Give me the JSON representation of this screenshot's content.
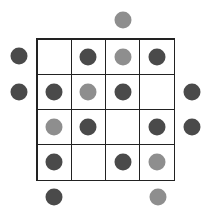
{
  "puzzle": {
    "rows": 4,
    "cols": 4,
    "colors": {
      "dark": "#4a4a4a",
      "light": "#8e8e8e",
      "grid_line": "#222222"
    },
    "grid": [
      [
        "empty",
        "dark",
        "light",
        "dark"
      ],
      [
        "dark",
        "light",
        "dark",
        "empty"
      ],
      [
        "light",
        "dark",
        "empty",
        "dark"
      ],
      [
        "dark",
        "empty",
        "dark",
        "light"
      ]
    ],
    "clues": {
      "top": [
        "empty",
        "empty",
        "light",
        "empty"
      ],
      "left": [
        "dark",
        "dark",
        "empty",
        "empty"
      ],
      "right": [
        "empty",
        "dark",
        "dark",
        "empty"
      ],
      "bottom": [
        "dark",
        "empty",
        "empty",
        "light"
      ]
    }
  }
}
